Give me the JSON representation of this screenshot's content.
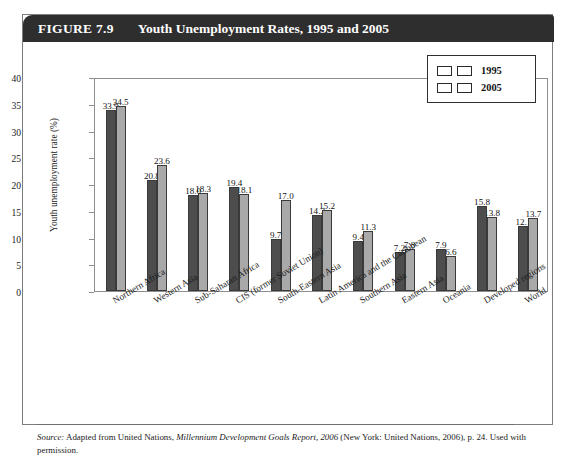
{
  "figure": {
    "number": "FIGURE 7.9",
    "title": "Youth Unemployment Rates, 1995 and 2005"
  },
  "source": {
    "label": "Source:",
    "text_before": " Adapted from United Nations, ",
    "italic_title": "Millennium Development Goals Report, 2006",
    "text_after": " (New York: United Nations, 2006), p. 24. Used with permission."
  },
  "chart_data": {
    "type": "bar",
    "title": "Youth Unemployment Rates, 1995 and 2005",
    "xlabel": "",
    "ylabel": "Youth unemployment rate (%)",
    "ylim": [
      0,
      40
    ],
    "yticks": [
      0,
      5,
      10,
      15,
      20,
      25,
      30,
      35,
      40
    ],
    "ytick_labels": [
      "0",
      "5",
      "10",
      "15",
      "20",
      "25",
      "30",
      "35",
      "40"
    ],
    "grid": false,
    "legend_position": "top-right",
    "categories": [
      "Northern Africa",
      "Western Asia",
      "Sub-Saharan Africa",
      "CIS (former Soviet Union)",
      "South-Eastern Asia",
      "Latin America and the Caribbean",
      "Southern Asia",
      "Eastern Asia",
      "Oceania",
      "Developed regions",
      "World"
    ],
    "series": [
      {
        "name": "1995",
        "color": "#4d4d4d",
        "values": [
          33.9,
          20.8,
          18.0,
          19.4,
          9.7,
          14.2,
          9.4,
          7.2,
          7.9,
          15.8,
          12.1
        ],
        "value_labels": [
          "33.9",
          "20.8",
          "18.0",
          "19.4",
          "9.7",
          "14.2",
          "9.4",
          "7.2",
          "7.9",
          "15.8",
          "12.1"
        ]
      },
      {
        "name": "2005",
        "color": "#a9a9a9",
        "values": [
          34.5,
          23.6,
          18.3,
          18.1,
          17.0,
          15.2,
          11.3,
          7.8,
          6.6,
          13.8,
          13.7
        ],
        "value_labels": [
          "34.5",
          "23.6",
          "18.3",
          "18.1",
          "17.0",
          "15.2",
          "11.3",
          "7.8",
          "6.6",
          "13.8",
          "13.7"
        ]
      }
    ]
  }
}
